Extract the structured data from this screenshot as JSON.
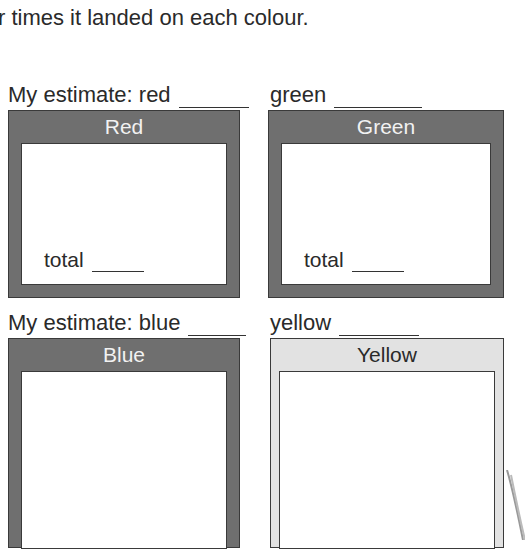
{
  "instructions": {
    "line": "r times it landed on each colour."
  },
  "estimates": {
    "row1": {
      "red_label": "My estimate:  red",
      "green_label": "green"
    },
    "row2": {
      "blue_label": "My estimate:  blue",
      "yellow_label": "yellow"
    }
  },
  "boxes": [
    {
      "title": "Red",
      "total_label": "total",
      "fill": "#6f6f6f"
    },
    {
      "title": "Green",
      "total_label": "total",
      "fill": "#6f6f6f"
    },
    {
      "title": "Blue",
      "fill": "#6f6f6f"
    },
    {
      "title": "Yellow",
      "fill": "#e2e2e2"
    }
  ]
}
